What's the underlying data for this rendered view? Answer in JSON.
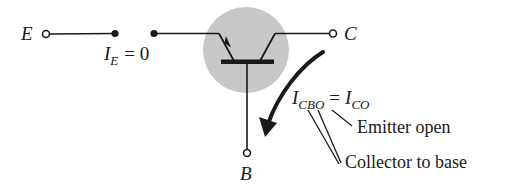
{
  "diagram": {
    "terminals": {
      "emitter": "E",
      "collector": "C",
      "base": "B"
    },
    "emitter_current": {
      "symbol": "I",
      "subscript": "E",
      "equals": "= 0"
    },
    "leakage_current": {
      "symbol": "I",
      "subscript": "CBO",
      "equals": "=",
      "alt_symbol": "I",
      "alt_subscript": "CO"
    },
    "annotations": {
      "emitter_open": "Emitter open",
      "collector_to_base": "Collector to base"
    },
    "colors": {
      "ink": "#1a1a1a",
      "transistor_disc": "#c8c8c8"
    }
  }
}
